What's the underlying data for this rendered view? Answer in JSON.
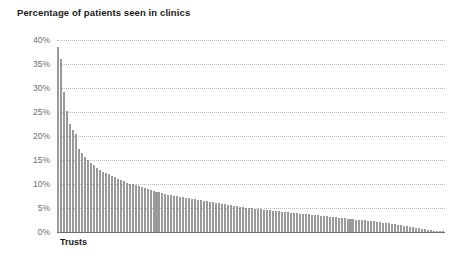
{
  "chart_data": {
    "type": "bar",
    "title": "Percentage of patients seen in clinics",
    "xlabel": "Trusts",
    "ylabel": "",
    "ylim": [
      0,
      40
    ],
    "grid": true,
    "legend": "none",
    "bar_color": "#9a9a9a",
    "axis_color": "#6f6f6f",
    "gridline_color": "#b9b9b9",
    "label_color": "#6d6d6d",
    "title_color": "#1a1a1a",
    "y_ticks": [
      "0%",
      "5%",
      "10%",
      "15%",
      "20%",
      "25%",
      "30%",
      "35%",
      "40%"
    ],
    "y_tick_values": [
      0,
      5,
      10,
      15,
      20,
      25,
      30,
      35,
      40
    ],
    "categories_note": "Individual NHS trusts, unlabelled, sorted descending",
    "bar_count": 130,
    "values": [
      38.6,
      36.0,
      29.2,
      25.3,
      22.4,
      21.3,
      20.4,
      17.3,
      16.4,
      15.6,
      15.0,
      14.4,
      13.9,
      13.4,
      13.0,
      12.6,
      12.3,
      12.0,
      11.7,
      11.4,
      11.1,
      10.8,
      10.6,
      10.3,
      10.1,
      9.9,
      9.7,
      9.5,
      9.3,
      9.1,
      8.9,
      8.7,
      8.6,
      8.4,
      8.3,
      8.1,
      8.0,
      7.8,
      7.7,
      7.6,
      7.4,
      7.3,
      7.2,
      7.1,
      7.0,
      6.9,
      6.8,
      6.7,
      6.6,
      6.5,
      6.4,
      6.3,
      6.2,
      6.1,
      6.0,
      5.9,
      5.8,
      5.7,
      5.6,
      5.5,
      5.4,
      5.3,
      5.2,
      5.1,
      5.0,
      4.9,
      4.85,
      4.8,
      4.7,
      4.6,
      4.55,
      4.5,
      4.4,
      4.35,
      4.3,
      4.2,
      4.15,
      4.1,
      4.0,
      3.95,
      3.9,
      3.85,
      3.8,
      3.7,
      3.65,
      3.6,
      3.5,
      3.45,
      3.4,
      3.3,
      3.25,
      3.2,
      3.1,
      3.05,
      3.0,
      2.9,
      2.85,
      2.8,
      2.7,
      2.65,
      2.6,
      2.5,
      2.45,
      2.4,
      2.3,
      2.25,
      2.2,
      2.1,
      2.0,
      1.95,
      1.85,
      1.8,
      1.7,
      1.6,
      1.5,
      1.4,
      1.3,
      1.2,
      1.1,
      1.0,
      0.9,
      0.8,
      0.7,
      0.6,
      0.5,
      0.4,
      0.3,
      0.2,
      0.1,
      0.05
    ]
  }
}
